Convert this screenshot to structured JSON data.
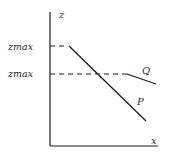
{
  "diagram": {
    "axes": {
      "y_label": "z",
      "x_label": "x"
    },
    "levels": [
      {
        "label": "zmax",
        "y": 46
      },
      {
        "label": "zmax",
        "y": 74
      }
    ],
    "curves": [
      {
        "label": "P",
        "from": [
          69,
          46
        ],
        "to": [
          146,
          121
        ]
      },
      {
        "label": "Q",
        "from": [
          127,
          74
        ],
        "to": [
          156,
          84
        ]
      }
    ],
    "colors": {
      "line": "#1a1a1a",
      "text": "#2a2a2a",
      "background": "#ffffff"
    }
  }
}
